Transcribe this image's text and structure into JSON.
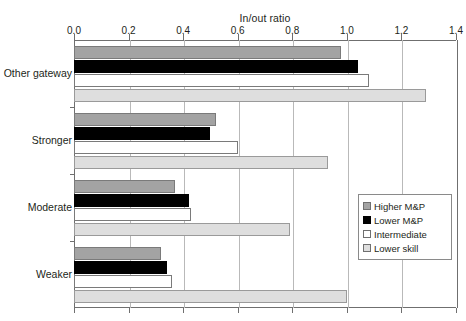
{
  "chart_data": {
    "type": "bar",
    "orientation": "horizontal",
    "title": "",
    "xlabel": "In/out ratio",
    "ylabel": "",
    "xlim": [
      0.0,
      1.4
    ],
    "xticks": [
      "0.0",
      "0.2",
      "0.4",
      "0.6",
      "0.8",
      "1.0",
      "1.2",
      "1.4"
    ],
    "xtick_values": [
      0.0,
      0.2,
      0.4,
      0.6,
      0.8,
      1.0,
      1.2,
      1.4
    ],
    "grid": true,
    "axis_position": "top",
    "legend_position": "right-inside",
    "categories": [
      "Other gateway",
      "Stronger",
      "Moderate",
      "Weaker"
    ],
    "series": [
      {
        "name": "Higher M&P",
        "color": "#a3a3a3",
        "values": [
          0.98,
          0.52,
          0.37,
          0.32
        ]
      },
      {
        "name": "Lower M&P",
        "color": "#000000",
        "values": [
          1.04,
          0.5,
          0.42,
          0.34
        ]
      },
      {
        "name": "Intermediate",
        "color": "#ffffff",
        "values": [
          1.08,
          0.6,
          0.43,
          0.36
        ]
      },
      {
        "name": "Lower skill",
        "color": "#dedede",
        "values": [
          1.29,
          0.93,
          0.79,
          1.0
        ]
      }
    ]
  },
  "legend": {
    "entries": [
      {
        "label": "Higher M&P"
      },
      {
        "label": "Lower M&P"
      },
      {
        "label": "Intermediate"
      },
      {
        "label": "Lower skill"
      }
    ]
  },
  "artifact": {
    "text": ""
  }
}
